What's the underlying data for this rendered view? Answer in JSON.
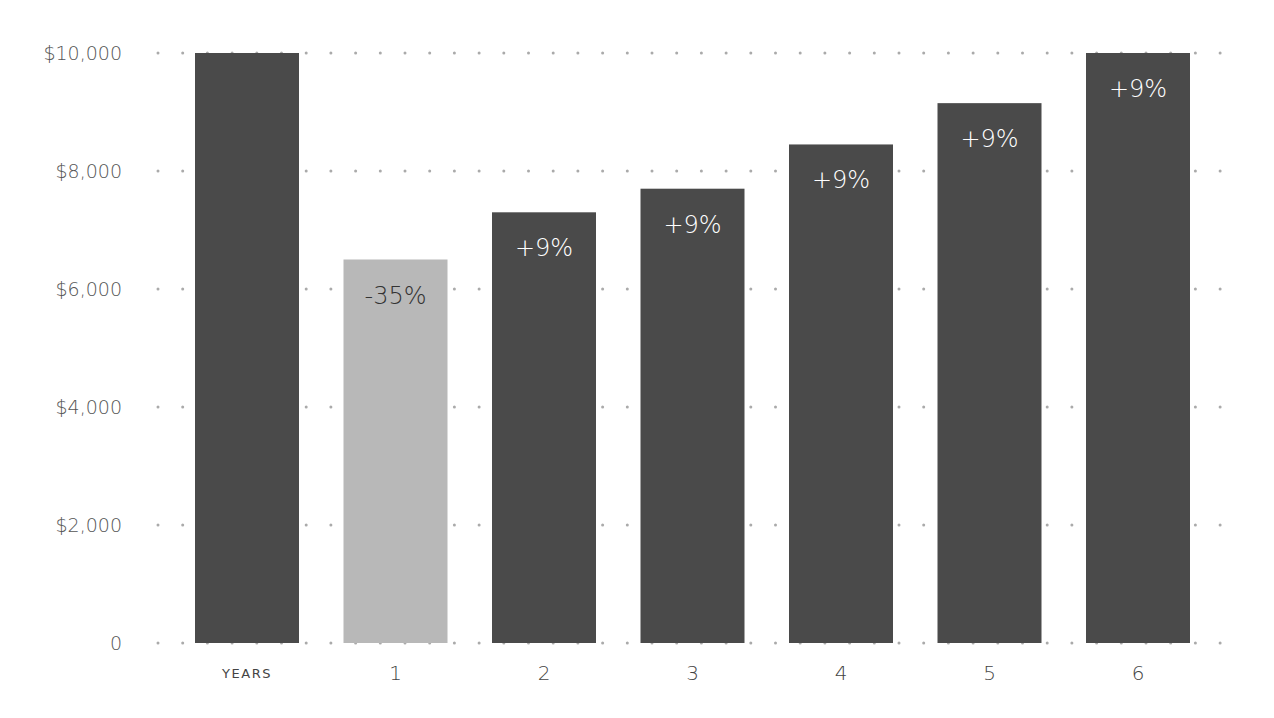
{
  "chart_data": {
    "type": "bar",
    "title": "",
    "xlabel": "",
    "ylabel": "",
    "categories": [
      "YEARS",
      "1",
      "2",
      "3",
      "4",
      "5",
      "6"
    ],
    "values": [
      10000,
      6500,
      7300,
      7700,
      8450,
      9150,
      10000
    ],
    "data_labels": [
      "",
      "-35%",
      "+9%",
      "+9%",
      "+9%",
      "+9%",
      "+9%"
    ],
    "ylim": [
      0,
      10000
    ],
    "yticks": [
      0,
      2000,
      4000,
      6000,
      8000,
      10000
    ],
    "ytick_labels": [
      "0",
      "$2,000",
      "$4,000",
      "$6,000",
      "$8,000",
      "$10,000"
    ],
    "grid": "dotted-horizontal",
    "legend": "none",
    "colors": {
      "default_bar": "#4a4a4a",
      "highlight_bar": "#b8b8b8",
      "label_on_dark": "#ffffff",
      "label_on_light": "#333333",
      "grid_dot": "#aaaaaa"
    },
    "highlight_index": 1
  }
}
